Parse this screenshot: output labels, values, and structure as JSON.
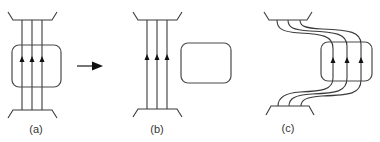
{
  "diagram": {
    "panels": [
      {
        "id": "a",
        "label": "(a)",
        "description": "Three parallel flux lines passing through a rounded box, arrows pointing up"
      },
      {
        "id": "b",
        "label": "(b)",
        "description": "Three parallel flux lines beside an empty rounded box"
      },
      {
        "id": "c",
        "label": "(c)",
        "description": "Three flux lines bent to pass through the displaced rounded box"
      }
    ],
    "transition_arrow": "right-arrow",
    "colors": {
      "line": "#3a3a3a",
      "arrow": "#111111",
      "background": "#ffffff"
    }
  }
}
